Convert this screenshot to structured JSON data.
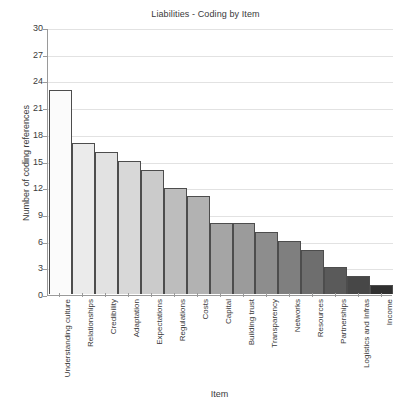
{
  "chart_data": {
    "type": "bar",
    "title": "Liabilities - Coding by Item",
    "xlabel": "Item",
    "ylabel": "Number of coding references",
    "ylim": [
      0,
      30
    ],
    "ytick_step": 3,
    "yticks": [
      0,
      3,
      6,
      9,
      12,
      15,
      18,
      21,
      24,
      27,
      30
    ],
    "grid": true,
    "legend": "none",
    "categories": [
      "Understanding culture",
      "Relationships",
      "Credibility",
      "Adaptation",
      "Expectations",
      "Regulations",
      "Costs",
      "Capital",
      "Building trust",
      "Transparency",
      "Networks",
      "Resources",
      "Partnerships",
      "Logistics and Infras",
      "Income"
    ],
    "values": [
      23,
      17,
      16,
      15,
      14,
      12,
      11,
      8,
      8,
      7,
      6,
      5,
      3,
      2,
      1
    ],
    "bar_colors": [
      "#fbfbfb",
      "#ebebeb",
      "#e2e2e2",
      "#d8d8d8",
      "#cbcbcb",
      "#bdbdbd",
      "#b2b2b2",
      "#a5a5a5",
      "#9b9b9b",
      "#8d8d8d",
      "#7f7f7f",
      "#6e6e6e",
      "#5a5a5a",
      "#474747",
      "#303030"
    ],
    "bar_border_color": "#4d4d4d",
    "grid_color": "#e2e2e2",
    "axis_color": "#9a9a9a",
    "text_color": "#3a3a3a",
    "background": "#ffffff"
  }
}
